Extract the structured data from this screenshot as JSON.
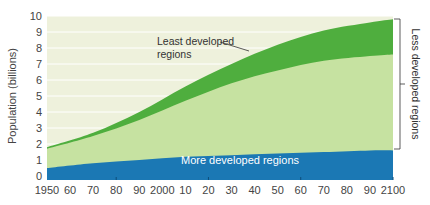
{
  "chart_data": {
    "type": "area",
    "title": "",
    "xlabel": "",
    "ylabel": "Population (billions)",
    "ylim": [
      0,
      10
    ],
    "xlim": [
      1950,
      2100
    ],
    "grid": true,
    "x_tick_labels": [
      "1950",
      "60",
      "70",
      "80",
      "90",
      "2000",
      "10",
      "20",
      "30",
      "40",
      "50",
      "60",
      "70",
      "80",
      "90",
      "2100"
    ],
    "y_tick_labels": [
      "0",
      "1",
      "2",
      "3",
      "4",
      "5",
      "6",
      "7",
      "8",
      "9",
      "10"
    ],
    "x": [
      1950,
      1970,
      1990,
      2010,
      2030,
      2050,
      2070,
      2090,
      2100
    ],
    "series": [
      {
        "name": "More developed regions",
        "color": "#1b78b4",
        "values": [
          0.5,
          0.8,
          1.0,
          1.2,
          1.3,
          1.4,
          1.5,
          1.6,
          1.6
        ]
      },
      {
        "name": "Less developed regions (excluding least developed)",
        "color": "#c6e2a1",
        "values": [
          1.2,
          1.7,
          2.5,
          3.5,
          4.5,
          5.2,
          5.7,
          5.9,
          6.0
        ]
      },
      {
        "name": "Least developed regions",
        "color": "#4fae3e",
        "values": [
          0.1,
          0.2,
          0.5,
          0.9,
          1.2,
          1.6,
          1.9,
          2.1,
          2.2
        ]
      }
    ],
    "stacked": true,
    "annotations": [
      {
        "text": "Least developed regions",
        "points_to": "Least developed regions band"
      },
      {
        "text": "More developed regions",
        "inside": "blue band"
      },
      {
        "text": "Less developed regions",
        "bracket": "right side, spanning both green bands"
      }
    ],
    "background_color": "#eef1dc"
  },
  "labels": {
    "ylabel": "Population (billions)",
    "least_line1": "Least developed",
    "least_line2": "regions",
    "more": "More developed regions",
    "less_bracket": "Less developed regions"
  }
}
